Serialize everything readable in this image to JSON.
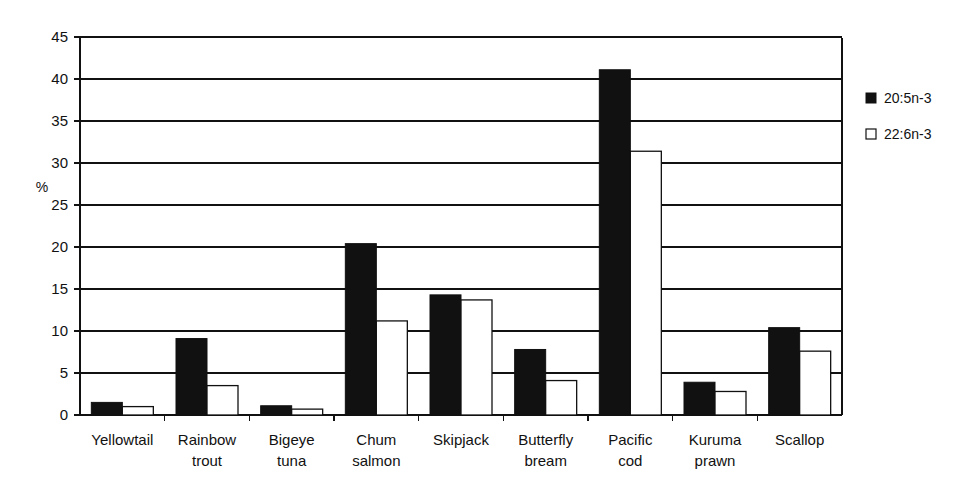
{
  "chart_data": {
    "type": "bar",
    "title": "",
    "subtitle": "",
    "xlabel": "",
    "ylabel": "%",
    "ylim": [
      0,
      45
    ],
    "ytick_step": 5,
    "yticks": [
      "0",
      "5",
      "10",
      "15",
      "20",
      "25",
      "30",
      "35",
      "40",
      "45"
    ],
    "grid": true,
    "legend_position": "right",
    "categories": [
      "Yellowtail",
      "Rainbow trout",
      "Bigeye tuna",
      "Chum salmon",
      "Skipjack",
      "Butterfly bream",
      "Pacific cod",
      "Kuruma prawn",
      "Scallop"
    ],
    "category_lines": [
      [
        "Yellowtail"
      ],
      [
        "Rainbow",
        "trout"
      ],
      [
        "Bigeye",
        "tuna"
      ],
      [
        "Chum",
        "salmon"
      ],
      [
        "Skipjack"
      ],
      [
        "Butterfly",
        "bream"
      ],
      [
        "Pacific",
        "cod"
      ],
      [
        "Kuruma",
        "prawn"
      ],
      [
        "Scallop"
      ]
    ],
    "series": [
      {
        "name": "20:5n-3",
        "style": "filled",
        "color": "#111111",
        "values": [
          1.5,
          9.1,
          1.1,
          20.4,
          14.3,
          7.8,
          41.1,
          3.9,
          10.4
        ]
      },
      {
        "name": "22:6n-3",
        "style": "open",
        "color": "#ffffff",
        "values": [
          1.0,
          3.5,
          0.7,
          11.2,
          13.7,
          4.1,
          31.4,
          2.8,
          7.6
        ]
      }
    ]
  },
  "legend": {
    "entries": [
      {
        "label": "20:5n-3",
        "marker": "filled-square-icon"
      },
      {
        "label": "22:6n-3",
        "marker": "open-square-icon"
      }
    ]
  },
  "axis": {
    "y_axis_title": "%"
  }
}
